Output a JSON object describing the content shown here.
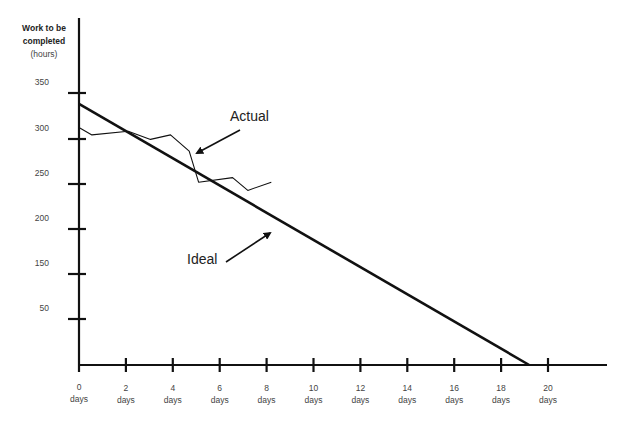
{
  "chart_data": {
    "type": "line",
    "title": "",
    "ylabel": "Work to be completed (hours)",
    "ylabel_bold": "Work to be completed",
    "ylabel_unit": "(hours)",
    "xlabel": "",
    "x_ticks": [
      "0",
      "2",
      "4",
      "6",
      "8",
      "10",
      "12",
      "14",
      "16",
      "18",
      "20"
    ],
    "x_tick_unit": "days",
    "y_ticks": [
      "350",
      "300",
      "250",
      "200",
      "150",
      "50"
    ],
    "xlim": [
      0,
      22
    ],
    "ylim": [
      0,
      370
    ],
    "grid": false,
    "series": [
      {
        "name": "Ideal",
        "style": "thick",
        "x": [
          0,
          19.2
        ],
        "values": [
          338,
          0
        ]
      },
      {
        "name": "Actual",
        "style": "thin",
        "x": [
          0,
          0.55,
          2.1,
          3.05,
          3.9,
          4.7,
          5.1,
          6.55,
          7.2,
          8.2
        ],
        "values": [
          312,
          304,
          308,
          299,
          304,
          286,
          252,
          257,
          243,
          252
        ]
      }
    ],
    "annotations": [
      {
        "text": "Actual",
        "arrow_to": "Actual series near day 5"
      },
      {
        "text": "Ideal",
        "arrow_to": "Ideal line near day 8"
      }
    ]
  },
  "labels": {
    "actual": "Actual",
    "ideal": "Ideal",
    "days": "days"
  }
}
